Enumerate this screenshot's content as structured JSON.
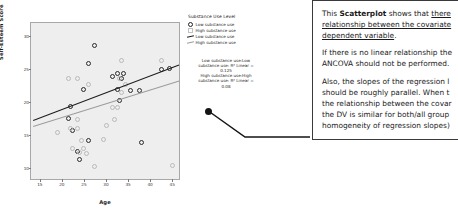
{
  "chart_data": {
    "type": "scatter",
    "title": "",
    "xlabel": "Age",
    "ylabel": "Self-Esteem Score",
    "xlim": [
      13,
      47
    ],
    "ylim": [
      8,
      32
    ],
    "xticks": [
      "15",
      "20",
      "25",
      "30",
      "35",
      "40",
      "45"
    ],
    "yticks": [
      "10",
      "15",
      "20",
      "25",
      "30"
    ],
    "grid": false,
    "legend_position": "right",
    "series": [
      {
        "name": "Low substance use",
        "marker": "open-circle-dark",
        "color": "#232323",
        "points": [
          [
            27.5,
            28.6
          ],
          [
            26.0,
            25.8
          ],
          [
            25.0,
            21.9
          ],
          [
            22.0,
            19.3
          ],
          [
            31.5,
            23.8
          ],
          [
            32.5,
            24.4
          ],
          [
            34.0,
            24.4
          ],
          [
            33.5,
            23.6
          ],
          [
            35.5,
            21.8
          ],
          [
            37.5,
            21.8
          ],
          [
            42.5,
            25.0
          ],
          [
            44.5,
            25.1
          ],
          [
            21.5,
            17.5
          ],
          [
            22.5,
            15.6
          ],
          [
            23.5,
            12.5
          ],
          [
            24.0,
            11.2
          ],
          [
            26.0,
            14.2
          ],
          [
            38.0,
            13.9
          ],
          [
            33.0,
            20.3
          ],
          [
            32.5,
            21.9
          ]
        ]
      },
      {
        "name": "High substance use",
        "marker": "open-square-grey",
        "color": "#c0c0c0",
        "points": [
          [
            33.5,
            26.3
          ],
          [
            42.5,
            26.3
          ],
          [
            23.5,
            23.5
          ],
          [
            21.5,
            23.6
          ],
          [
            26.0,
            22.7
          ],
          [
            33.0,
            23.6
          ],
          [
            34.5,
            22.6
          ],
          [
            33.5,
            21.5
          ],
          [
            32.5,
            19.2
          ],
          [
            19.0,
            15.3
          ],
          [
            22.0,
            16.0
          ],
          [
            23.5,
            17.3
          ],
          [
            23.5,
            15.9
          ],
          [
            24.5,
            14.1
          ],
          [
            22.5,
            12.9
          ],
          [
            24.0,
            12.4
          ],
          [
            25.5,
            12.2
          ],
          [
            31.5,
            19.2
          ],
          [
            30.0,
            16.4
          ],
          [
            32.0,
            17.3
          ],
          [
            27.5,
            10.2
          ],
          [
            45.0,
            10.3
          ],
          [
            29.5,
            14.3
          ],
          [
            25.0,
            13.0
          ]
        ]
      }
    ],
    "regression_lines": [
      {
        "name": "Low substance use",
        "color": "#1d1d1d",
        "x0": 13.5,
        "y0": 17.2,
        "x1": 46.5,
        "y1": 25.6
      },
      {
        "name": "High substance use",
        "color": "#9c9c9c",
        "x0": 13.5,
        "y0": 16.3,
        "x1": 46.5,
        "y1": 23.2
      }
    ]
  },
  "legend": {
    "title": "Substance Use Level",
    "items": [
      {
        "label": "Low substance use",
        "swatch": "low-mark"
      },
      {
        "label": "High substance use",
        "swatch": "high-mark"
      },
      {
        "label": "Low substance use",
        "swatch": "low-line"
      },
      {
        "label": "High substance use",
        "swatch": "high-line"
      }
    ]
  },
  "annotations": {
    "low_line1": "Low substance use:Low",
    "low_line2": "substance use: R² Linear =",
    "low_value": "0.125",
    "high_line1": "High substance use:High",
    "high_line2": "substance use: R² Linear =",
    "high_value": "0.08"
  },
  "callout": {
    "para1_a": "This ",
    "para1_bold": "Scatterplot",
    "para1_b": " shows that ",
    "para1_u": "there",
    "para2_u": "relationship between the covariate",
    "para3_u": "dependent variable",
    "para3_end": ".",
    "para4": "If there is no linear relationship the",
    "para5": "ANCOVA should not be performed.",
    "para6": "Also, the slopes of the regression l",
    "para7": "should be roughly parallel. When t",
    "para8": "the relationship between the covar",
    "para9": "the DV is similar for both/all group",
    "para10": "homogeneity of regression slopes)"
  }
}
